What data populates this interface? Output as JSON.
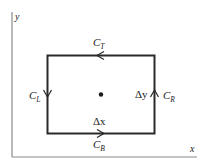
{
  "diagram": {
    "type": "closed-contour-rectangle",
    "axes": {
      "x_label": "x",
      "y_label": "y"
    },
    "rectangle": {
      "sides": [
        {
          "id": "top",
          "label_main": "C",
          "label_sub": "T",
          "direction": "left"
        },
        {
          "id": "left",
          "label_main": "C",
          "label_sub": "L",
          "direction": "down"
        },
        {
          "id": "right",
          "label_main": "C",
          "label_sub": "R",
          "direction": "up"
        },
        {
          "id": "bottom",
          "label_main": "C",
          "label_sub": "B",
          "direction": "right"
        }
      ],
      "width_label": "Δx",
      "height_label": "Δy",
      "center_point": "dot"
    },
    "colors": {
      "line": "#2a2a2a",
      "axis": "#8a8a8a",
      "background": "#ffffff"
    }
  },
  "labels": {
    "x_axis": "x",
    "y_axis": "y",
    "c_main": "C",
    "top_sub": "T",
    "left_sub": "L",
    "right_sub": "R",
    "bottom_sub": "B",
    "delta_x": "Δx",
    "delta_y": "Δy"
  }
}
